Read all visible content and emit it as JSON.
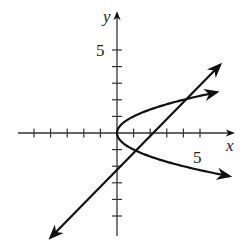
{
  "chart_data": {
    "type": "line",
    "title": "",
    "xlabel": "x",
    "ylabel": "y",
    "x_tick_label": "5",
    "y_tick_label": "5",
    "xlim": [
      -5.5,
      7
    ],
    "ylim": [
      -6.5,
      7
    ],
    "x_ticks": [
      -5,
      -4,
      -3,
      -2,
      -1,
      1,
      2,
      3,
      4,
      5
    ],
    "y_ticks": [
      -5,
      -4,
      -3,
      -2,
      -1,
      1,
      2,
      3,
      4,
      5
    ],
    "grid": false,
    "legend": null,
    "series": [
      {
        "name": "parabola",
        "equation": "x = y^2",
        "vertex": [
          0,
          0
        ],
        "points": [
          [
            6.3,
            -2.5
          ],
          [
            4,
            -2
          ],
          [
            2.25,
            -1.5
          ],
          [
            1,
            -1
          ],
          [
            0.25,
            -0.5
          ],
          [
            0,
            0
          ],
          [
            0.25,
            0.5
          ],
          [
            1,
            1
          ],
          [
            2.25,
            1.5
          ],
          [
            4,
            2
          ],
          [
            6.1,
            2.47
          ]
        ],
        "arrows_both_ends": true
      },
      {
        "name": "line",
        "equation": "y = x - 2",
        "points": [
          [
            -4,
            -6.3
          ],
          [
            0,
            -2
          ],
          [
            2,
            0
          ],
          [
            6.2,
            4.1
          ]
        ],
        "arrows_both_ends": true
      }
    ],
    "intersections": [
      [
        4,
        2
      ],
      [
        1,
        -1
      ]
    ],
    "colors": {
      "curve": "#111111",
      "axis": "#333333",
      "text": "#222222"
    }
  },
  "labels": {
    "x_axis": "x",
    "y_axis": "y",
    "x_five": "5",
    "y_five": "5"
  }
}
